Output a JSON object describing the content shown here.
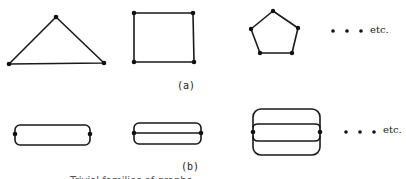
{
  "figure": {
    "part_a": {
      "label": "(a)",
      "graphs": [
        {
          "name": "triangle",
          "vertices": 3
        },
        {
          "name": "square",
          "vertices": 4
        },
        {
          "name": "pentagon",
          "vertices": 5
        }
      ],
      "continuation": "etc."
    },
    "part_b": {
      "label": "(b)",
      "graphs": [
        {
          "name": "two-vertex-2-edges",
          "vertices": 2,
          "edges": 2
        },
        {
          "name": "two-vertex-3-edges",
          "vertices": 2,
          "edges": 3
        },
        {
          "name": "two-vertex-4-edges",
          "vertices": 2,
          "edges": 4
        }
      ],
      "continuation": "etc."
    },
    "caption": "Trivial families of graphs"
  }
}
